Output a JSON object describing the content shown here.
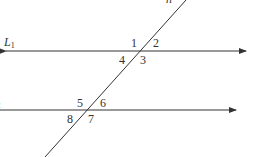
{
  "diagram": {
    "type": "parallel lines cut by a transversal",
    "lines": {
      "line1": {
        "label": "L",
        "subscript": "1"
      },
      "line2": {
        "label": "L",
        "subscript": "2"
      },
      "transversal": {
        "label": "n"
      }
    },
    "angles_line1": [
      "1",
      "2",
      "3",
      "4"
    ],
    "angles_line2": [
      "5",
      "6",
      "7",
      "8"
    ],
    "colors": {
      "stroke": "#333333",
      "background": "#ffffff"
    }
  }
}
